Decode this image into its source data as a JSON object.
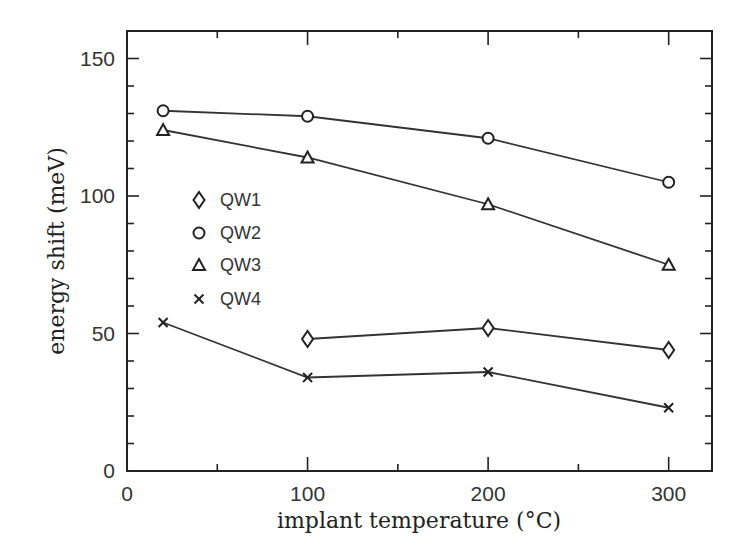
{
  "chart_data": {
    "type": "line",
    "title": "",
    "xlabel": "implant temperature (°C)",
    "ylabel": "energy shift (meV)",
    "xlim": [
      0,
      324
    ],
    "ylim": [
      0,
      160
    ],
    "x_ticks": [
      0,
      100,
      200,
      300
    ],
    "x_minor_step": 50,
    "y_ticks": [
      0,
      50,
      100,
      150
    ],
    "y_minor_step": 10,
    "grid": false,
    "legend_position": "inside-left",
    "series": [
      {
        "name": "QW1",
        "marker": "diamond",
        "x": [
          100,
          200,
          300
        ],
        "values": [
          48,
          52,
          44
        ]
      },
      {
        "name": "QW2",
        "marker": "circle",
        "x": [
          20,
          100,
          200,
          300
        ],
        "values": [
          131,
          129,
          121,
          105
        ]
      },
      {
        "name": "QW3",
        "marker": "triangle",
        "x": [
          20,
          100,
          200,
          300
        ],
        "values": [
          124,
          114,
          97,
          75
        ]
      },
      {
        "name": "QW4",
        "marker": "cross",
        "x": [
          20,
          100,
          200,
          300
        ],
        "values": [
          54,
          34,
          36,
          23
        ]
      }
    ]
  },
  "legend": {
    "items": [
      {
        "label": "QW1",
        "marker": "diamond"
      },
      {
        "label": "QW2",
        "marker": "circle"
      },
      {
        "label": "QW3",
        "marker": "triangle"
      },
      {
        "label": "QW4",
        "marker": "cross"
      }
    ]
  },
  "colors": {
    "ink": "#222222",
    "background": "#ffffff"
  }
}
